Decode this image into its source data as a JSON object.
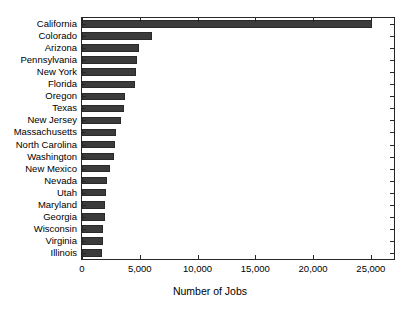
{
  "chart_data": {
    "type": "bar",
    "orientation": "horizontal",
    "title": "",
    "xlabel": "Number of Jobs",
    "ylabel": "",
    "xlim": [
      0,
      27000
    ],
    "xticks": [
      0,
      5000,
      10000,
      15000,
      20000,
      25000
    ],
    "xticklabels": [
      "0",
      "5,000",
      "10,000",
      "15,000",
      "20,000",
      "25,000"
    ],
    "grid": false,
    "legend": null,
    "bar_color": "#3b3b3b",
    "background_color": "#ffffff",
    "axes_color": "#262626",
    "categories": [
      "California",
      "Colorado",
      "Arizona",
      "Pennsylvania",
      "New York",
      "Florida",
      "Oregon",
      "Texas",
      "New Jersey",
      "Massachusetts",
      "North Carolina",
      "Washington",
      "New Mexico",
      "Nevada",
      "Utah",
      "Maryland",
      "Georgia",
      "Wisconsin",
      "Virginia",
      "Illinois"
    ],
    "values": [
      25100,
      6100,
      4900,
      4750,
      4650,
      4550,
      3700,
      3650,
      3400,
      2900,
      2850,
      2800,
      2400,
      2200,
      2100,
      2000,
      1950,
      1850,
      1800,
      1700
    ]
  }
}
